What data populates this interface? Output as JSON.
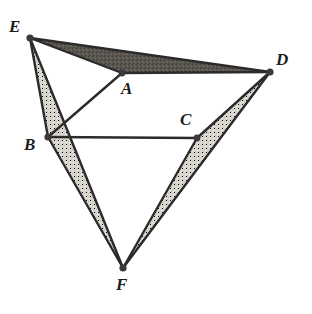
{
  "figure": {
    "background_color": "#ffffff",
    "stroke_color": "#2b2b2b",
    "vertex_dot_color": "#3a3a3a",
    "shade_dark_color": "#5a564f",
    "shade_light_color": "#d9d6cf",
    "points": [
      {
        "id": "E",
        "label": "E",
        "x": 30,
        "y": 38,
        "label_x": 9,
        "label_y": 18
      },
      {
        "id": "D",
        "label": "D",
        "x": 270,
        "y": 72,
        "label_x": 276,
        "label_y": 51
      },
      {
        "id": "A",
        "label": "A",
        "x": 122,
        "y": 73,
        "label_x": 121,
        "label_y": 80
      },
      {
        "id": "C",
        "label": "C",
        "x": 197,
        "y": 138,
        "label_x": 180,
        "label_y": 111
      },
      {
        "id": "B",
        "label": "B",
        "x": 48,
        "y": 137,
        "label_x": 24,
        "label_y": 136
      },
      {
        "id": "F",
        "label": "F",
        "x": 123,
        "y": 268,
        "label_x": 116,
        "label_y": 276
      }
    ],
    "segments": [
      {
        "id": "EA",
        "from": "E",
        "to": "A"
      },
      {
        "id": "AD",
        "from": "A",
        "to": "D"
      },
      {
        "id": "ED",
        "from": "E",
        "to": "D"
      },
      {
        "id": "EB",
        "from": "E",
        "to": "B"
      },
      {
        "id": "EF",
        "from": "E",
        "to": "F"
      },
      {
        "id": "BA",
        "from": "B",
        "to": "A"
      },
      {
        "id": "BC",
        "from": "B",
        "to": "C"
      },
      {
        "id": "BF",
        "from": "B",
        "to": "F"
      },
      {
        "id": "CD",
        "from": "C",
        "to": "D"
      },
      {
        "id": "CF",
        "from": "C",
        "to": "F"
      },
      {
        "id": "DF",
        "from": "D",
        "to": "F"
      }
    ],
    "shaded_regions": [
      {
        "id": "EAD",
        "vertices": [
          "E",
          "A",
          "D"
        ],
        "shade": "dark"
      },
      {
        "id": "EBF",
        "vertices": [
          "E",
          "B",
          "F"
        ],
        "shade": "light"
      },
      {
        "id": "DCF",
        "vertices": [
          "D",
          "C",
          "F"
        ],
        "shade": "light"
      }
    ]
  },
  "chart_data": {
    "type": "diagram",
    "vertices": {
      "A": [
        122,
        73
      ],
      "B": [
        48,
        137
      ],
      "C": [
        197,
        138
      ],
      "D": [
        270,
        72
      ],
      "E": [
        30,
        38
      ],
      "F": [
        123,
        268
      ]
    },
    "edges": [
      [
        "E",
        "A"
      ],
      [
        "A",
        "D"
      ],
      [
        "E",
        "D"
      ],
      [
        "E",
        "B"
      ],
      [
        "E",
        "F"
      ],
      [
        "B",
        "A"
      ],
      [
        "B",
        "C"
      ],
      [
        "B",
        "F"
      ],
      [
        "C",
        "D"
      ],
      [
        "C",
        "F"
      ],
      [
        "D",
        "F"
      ]
    ],
    "shaded_triangles": [
      {
        "vertices": [
          "E",
          "A",
          "D"
        ],
        "fill": "#5a564f"
      },
      {
        "vertices": [
          "E",
          "B",
          "F"
        ],
        "fill": "#d9d6cf"
      },
      {
        "vertices": [
          "D",
          "C",
          "F"
        ],
        "fill": "#d9d6cf"
      }
    ],
    "labels": [
      "A",
      "B",
      "C",
      "D",
      "E",
      "F"
    ],
    "xlim": [
      0,
      312
    ],
    "ylim": [
      0,
      314
    ],
    "grid": false,
    "legend": null
  }
}
